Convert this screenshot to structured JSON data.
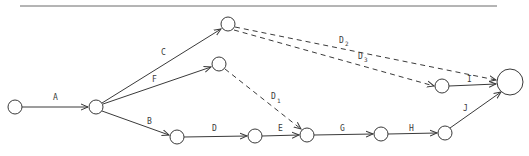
{
  "diagram": {
    "type": "activity-on-arrow network",
    "nodes": [
      {
        "id": "n1",
        "x": 15,
        "y": 107,
        "r": 7
      },
      {
        "id": "n2",
        "x": 96,
        "y": 107,
        "r": 7
      },
      {
        "id": "n3",
        "x": 228,
        "y": 24,
        "r": 7
      },
      {
        "id": "n4",
        "x": 219,
        "y": 64,
        "r": 7
      },
      {
        "id": "n5",
        "x": 177,
        "y": 137,
        "r": 7
      },
      {
        "id": "n6",
        "x": 255,
        "y": 136,
        "r": 7
      },
      {
        "id": "n7",
        "x": 307,
        "y": 135,
        "r": 7
      },
      {
        "id": "n8",
        "x": 381,
        "y": 134,
        "r": 7
      },
      {
        "id": "n9",
        "x": 445,
        "y": 133,
        "r": 7
      },
      {
        "id": "n10",
        "x": 442,
        "y": 86,
        "r": 7
      },
      {
        "id": "n11",
        "x": 510,
        "y": 82,
        "r": 13
      }
    ],
    "edges": [
      {
        "label": "A",
        "sub": "",
        "from": "n1",
        "to": "n2",
        "dashed": false
      },
      {
        "label": "C",
        "sub": "",
        "from": "n2",
        "to": "n3",
        "dashed": false
      },
      {
        "label": "F",
        "sub": "",
        "from": "n2",
        "to": "n4",
        "dashed": false
      },
      {
        "label": "B",
        "sub": "",
        "from": "n2",
        "to": "n5",
        "dashed": false
      },
      {
        "label": "D",
        "sub": "",
        "from": "n5",
        "to": "n6",
        "dashed": false
      },
      {
        "label": "E",
        "sub": "",
        "from": "n6",
        "to": "n7",
        "dashed": false
      },
      {
        "label": "G",
        "sub": "",
        "from": "n7",
        "to": "n8",
        "dashed": false
      },
      {
        "label": "H",
        "sub": "",
        "from": "n8",
        "to": "n9",
        "dashed": false
      },
      {
        "label": "J",
        "sub": "",
        "from": "n9",
        "to": "n11",
        "dashed": false
      },
      {
        "label": "I",
        "sub": "",
        "from": "n10",
        "to": "n11",
        "dashed": false
      },
      {
        "label": "D",
        "sub": "1",
        "from": "n4",
        "to": "n7",
        "dashed": true
      },
      {
        "label": "D",
        "sub": "2",
        "from": "n3",
        "to": "n11",
        "dashed": true
      },
      {
        "label": "D",
        "sub": "3",
        "from": "n3",
        "to": "n10",
        "dashed": true
      }
    ],
    "labels": {
      "A": "A",
      "B": "B",
      "C": "C",
      "D": "D",
      "E": "E",
      "F": "F",
      "G": "G",
      "H": "H",
      "I": "I",
      "J": "J",
      "D1_main": "D",
      "D1_sub": "1",
      "D2_main": "D",
      "D2_sub": "2",
      "D3_main": "D",
      "D3_sub": "3"
    },
    "colors": {
      "line": "#3a3a3a",
      "rule": "#6a6a6a",
      "background": "#ffffff"
    }
  }
}
